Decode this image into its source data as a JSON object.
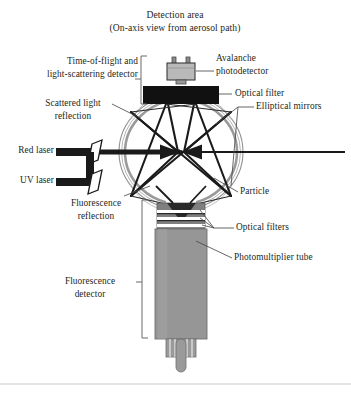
{
  "figure": {
    "title_line1": "Detection area",
    "title_line2": "(On-axis view from aerosol path)",
    "domain": "optical bioaerosol detector schematic"
  },
  "labels": {
    "time_of_flight_l1": "Time-of-flight and",
    "time_of_flight_l2": "light-scattering detector",
    "avalanche_l1": "Avalanche",
    "avalanche_l2": "photodetector",
    "optical_filter": "Optical filter",
    "scattered_l1": "Scattered light",
    "scattered_l2": "reflection",
    "elliptical_mirrors": "Elliptical mirrors",
    "red_laser": "Red laser",
    "uv_laser": "UV laser",
    "particle": "Particle",
    "fluorescence_refl_l1": "Fluorescence",
    "fluorescence_refl_l2": "reflection",
    "optical_filters": "Optical filters",
    "photomultiplier_tube": "Photomultiplier tube",
    "fluorescence_det_l1": "Fluorescence",
    "fluorescence_det_l2": "detector"
  },
  "colors": {
    "ink": "#231f20",
    "beam_black": "#1a1a1a",
    "mirror_gray": "#8f8f8f",
    "pmt_gray": "#969696",
    "filter_gray": "#7d7d7d",
    "apd_gray": "#b4b4b4",
    "leader_gray": "#4a4a4a",
    "background": "#ffffff",
    "border": "#c8c8c8"
  }
}
